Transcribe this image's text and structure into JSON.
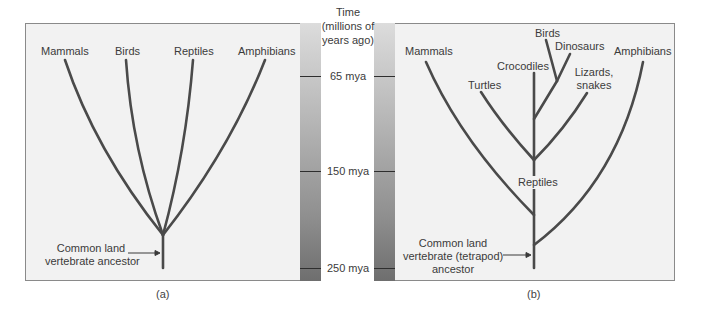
{
  "figure": {
    "panel_a": {
      "caption": "(a)",
      "taxa": {
        "mammals": "Mammals",
        "birds": "Birds",
        "reptiles": "Reptiles",
        "amphibians": "Amphibians"
      },
      "ancestor_label_line1": "Common land",
      "ancestor_label_line2": "vertebrate ancestor"
    },
    "panel_b": {
      "caption": "(b)",
      "taxa": {
        "mammals": "Mammals",
        "birds": "Birds",
        "dinosaurs": "Dinosaurs",
        "crocodiles": "Crocodiles",
        "turtles": "Turtles",
        "lizards_line1": "Lizards,",
        "lizards_line2": "snakes",
        "amphibians": "Amphibians",
        "reptiles": "Reptiles"
      },
      "ancestor_label_line1": "Common land",
      "ancestor_label_line2": "vertebrate (tetrapod)",
      "ancestor_label_line3": "ancestor"
    },
    "timescale": {
      "title_line1": "Time",
      "title_line2": "(millions of",
      "title_line3": "years ago)",
      "ticks": [
        "65 mya",
        "150 mya",
        "250 mya"
      ]
    },
    "colors": {
      "branch": "#4a4a4a",
      "panel_bg": "#f2f2f2",
      "border": "#8a8a8a"
    }
  }
}
